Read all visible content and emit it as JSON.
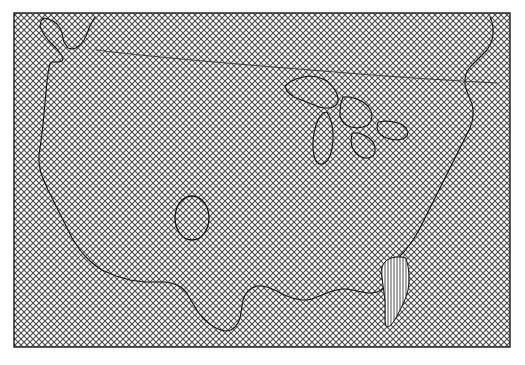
{
  "figure": {
    "type": "map",
    "title": "",
    "width": 525,
    "height": 365,
    "background_color": "#ffffff"
  },
  "plot_area": {
    "name": "map-frame",
    "x": 14,
    "y": 13,
    "width": 496,
    "height": 334,
    "border_color": "#1a1a1a",
    "border_width": 1,
    "fill_pattern": "crosshatch-diagonal",
    "fill_color": "#ffffff",
    "pattern_stroke_color": "#3c3c3c",
    "pattern_spacing_px": 6,
    "pattern_stroke_width": 1
  },
  "layers": {
    "coastline": {
      "name": "national-outline",
      "stroke_color": "#151515",
      "stroke_width": 1.1,
      "fill": "none"
    },
    "great_lakes": {
      "name": "great-lakes-outline",
      "stroke_color": "#151515",
      "stroke_width": 1.1,
      "fill": "none"
    },
    "northern_line": {
      "name": "northern-boundary-arc",
      "stroke_color": "#2a2a2a",
      "stroke_width": 0.8,
      "fill": "none"
    },
    "oval_region": {
      "name": "central-oval-region",
      "stroke_color": "#151515",
      "stroke_width": 1.3,
      "fill": "none",
      "center_x": 192,
      "center_y": 218,
      "radius_x": 17,
      "radius_y": 22
    },
    "highlight_region": {
      "name": "florida-highlight-region",
      "stroke_color": "#151515",
      "stroke_width": 1.0,
      "fill_pattern": "vertical-lines",
      "pattern_stroke_color": "#3a3a3a",
      "pattern_spacing_px": 3,
      "pattern_stroke_width": 0.8
    }
  },
  "geometry": {
    "outline_path": "M 95,17 L 92,22 L 89,28 L 87,34 L 84,40 L 80,45 L 76,48 L 72,49 L 68,48 L 66,45 L 64,42 L 63,38 L 62,33 L 60,28 L 57,24 L 53,21 L 48,19 L 44,18 L 41,21 L 40,26 L 42,31 L 45,36 L 49,41 L 53,45 L 57,49 L 60,53 L 62,56 L 63,59 L 62,61 L 59,62 L 55,62 L 52,62 L 50,64 L 49,68 L 48,74 L 47,82 L 46,92 L 45,103 L 44,114 L 43,124 L 42,133 L 41,141 L 40,148 L 39,155 L 39,162 L 40,169 L 42,176 L 45,183 L 48,190 L 51,196 L 54,202 L 57,208 L 60,214 L 63,220 L 66,226 L 69,232 L 72,238 L 76,244 L 80,250 L 85,256 L 90,261 L 96,266 L 102,270 L 109,273 L 116,276 L 123,278 L 130,280 L 137,281 L 144,282 L 151,282 L 158,282 L 165,282 L 171,283 L 177,285 L 182,288 L 186,292 L 189,297 L 192,302 L 195,307 L 198,312 L 202,317 L 206,321 L 211,325 L 216,328 L 221,330 L 226,331 L 231,330 L 235,327 L 238,323 L 240,318 L 241,312 L 242,306 L 243,300 L 245,295 L 248,291 L 252,288 L 257,286 L 262,286 L 267,287 L 272,289 L 277,291 L 282,294 L 287,296 L 292,298 L 297,299 L 302,300 L 307,300 L 312,299 L 317,297 L 322,295 L 327,293 L 332,291 L 337,290 L 342,289 L 347,289 L 352,290 L 357,291 L 362,292 L 367,293 L 372,293 L 377,292 L 381,290 L 384,287 L 386,283 L 388,279 L 390,275 L 392,271 L 394,267 L 396,263 L 398,259 L 401,255 L 404,252 L 407,248 L 410,244 L 413,240 L 416,235 L 419,230 L 422,224 L 425,218 L 428,212 L 431,206 L 434,200 L 437,194 L 440,188 L 443,182 L 446,176 L 449,170 L 452,164 L 455,158 L 458,152 L 461,146 L 464,140 L 467,134 L 470,128 L 472,122 L 473,116 L 473,110 L 472,104 L 470,99 L 468,94 L 466,89 L 465,84 L 465,79 L 466,74 L 468,70 L 471,66 L 475,62 L 479,58 L 483,54 L 487,50 L 490,45 L 492,40 L 493,34 L 493,28 L 492,22 L 490,17",
    "great_lakes_paths": [
      "M 285,86 L 290,82 L 296,79 L 303,77 L 310,76 L 317,77 L 323,79 L 328,82 L 332,86 L 335,90 L 337,94 L 338,98 L 338,102 L 336,105 L 333,107 L 329,108 L 324,108 L 319,107 L 314,105 L 309,103 L 304,101 L 299,99 L 294,97 L 290,94 L 287,91 Z",
      "M 327,112 L 330,118 L 332,125 L 333,133 L 333,141 L 332,149 L 330,156 L 327,161 L 323,164 L 319,164 L 316,161 L 314,156 L 313,149 L 313,141 L 314,133 L 316,125 L 319,118 L 323,113 Z",
      "M 343,97 L 350,97 L 357,99 L 363,102 L 368,106 L 371,111 L 372,116 L 371,121 L 368,125 L 363,127 L 357,128 L 351,127 L 346,125 L 342,121 L 340,116 L 340,110 L 341,103 Z",
      "M 352,133 L 358,133 L 364,135 L 369,138 L 373,142 L 375,147 L 375,152 L 373,156 L 369,158 L 364,158 L 359,156 L 355,152 L 352,147 L 351,141 Z",
      "M 378,122 L 386,121 L 394,122 L 401,124 L 406,128 L 408,132 L 407,136 L 403,139 L 397,140 L 390,139 L 384,137 L 379,133 L 377,128 Z"
    ],
    "northern_arc_path": "M 96,50 C 160,58 260,66 360,74 C 410,78 460,81 497,83",
    "highlight_path": "M 406,258 L 408,266 L 409,274 L 409,282 L 408,290 L 406,297 L 403,304 L 400,310 L 397,316 L 394,321 L 391,325 L 388,327 L 386,326 L 385,322 L 385,316 L 385,309 L 385,301 L 384,293 L 383,285 L 382,278 L 381,272 L 382,267 L 384,263 L 387,260 L 391,258 L 396,257 L 401,257 Z"
  }
}
